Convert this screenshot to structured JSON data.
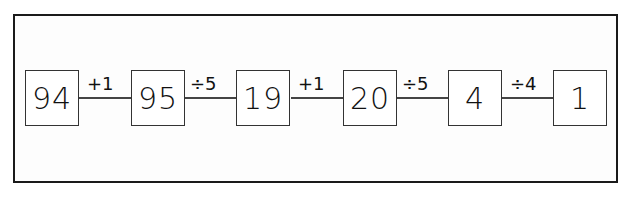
{
  "diagram": {
    "type": "function-machine-chain",
    "values": [
      "94",
      "95",
      "19",
      "20",
      "4",
      "1"
    ],
    "operations": [
      "+1",
      "÷5",
      "+1",
      "÷5",
      "÷4"
    ],
    "colors": {
      "stroke": "#1a1a1a",
      "background": "#ffffff"
    }
  }
}
